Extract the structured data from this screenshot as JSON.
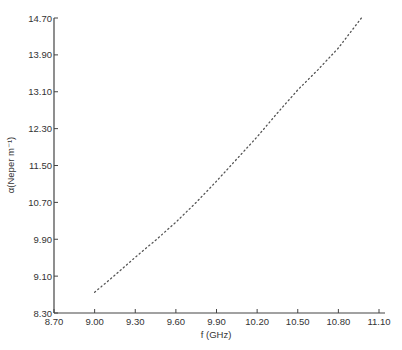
{
  "chart_data": {
    "type": "line",
    "title": "",
    "xlabel": "f (GHz)",
    "ylabel": "α(Neper m⁻¹)",
    "xlim": [
      8.7,
      11.1
    ],
    "ylim": [
      8.3,
      14.7
    ],
    "x_ticks": [
      "8.70",
      "9.00",
      "9.30",
      "9.60",
      "9.90",
      "10.20",
      "10.50",
      "10.80",
      "11.10"
    ],
    "y_ticks": [
      "8.30",
      "9.10",
      "9.90",
      "10.70",
      "11.50",
      "12.30",
      "13.10",
      "13.90",
      "14.70"
    ],
    "grid": false,
    "legend": null,
    "line_style": "dotted",
    "series": [
      {
        "name": "attenuation",
        "x": [
          9.0,
          9.15,
          9.3,
          9.45,
          9.6,
          9.75,
          9.9,
          10.05,
          10.2,
          10.35,
          10.5,
          10.65,
          10.8,
          10.97
        ],
        "y": [
          8.75,
          9.12,
          9.51,
          9.88,
          10.27,
          10.7,
          11.16,
          11.64,
          12.12,
          12.64,
          13.14,
          13.58,
          14.05,
          14.7
        ]
      }
    ]
  }
}
